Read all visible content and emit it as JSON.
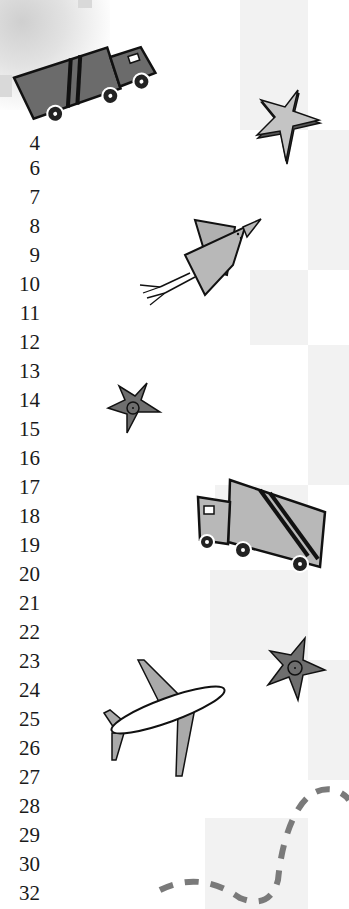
{
  "page": {
    "type": "scanned-book-page-margin",
    "background_colors": {
      "paper": "#ffffff",
      "tile": "#f2f2f2",
      "ink": "#1a1a1a",
      "fill_dark": "#6b6b6b",
      "fill_light": "#b8b8b8",
      "dash": "#7a7a7a"
    }
  },
  "line_numbers": [
    "4",
    "6",
    "7",
    "8",
    "9",
    "10",
    "11",
    "12",
    "13",
    "14",
    "15",
    "16",
    "17",
    "18",
    "19",
    "20",
    "21",
    "22",
    "23",
    "24",
    "25",
    "26",
    "27",
    "28",
    "29",
    "30",
    "32"
  ],
  "illustrations": [
    {
      "name": "truck-dark",
      "description": "dark gray garbage truck tilted, top-left"
    },
    {
      "name": "star-light",
      "description": "light gray 3D star, top-right"
    },
    {
      "name": "bird",
      "description": "gray paper bird with stick legs"
    },
    {
      "name": "star-dark-small",
      "description": "dark gray star with circle center"
    },
    {
      "name": "truck-light",
      "description": "light gray truck facing left"
    },
    {
      "name": "star-dark-right",
      "description": "dark gray star with circle center, right side"
    },
    {
      "name": "airplane",
      "description": "white airplane with gray wings"
    },
    {
      "name": "dashed-path",
      "description": "gray dashed curvy path at bottom"
    }
  ]
}
